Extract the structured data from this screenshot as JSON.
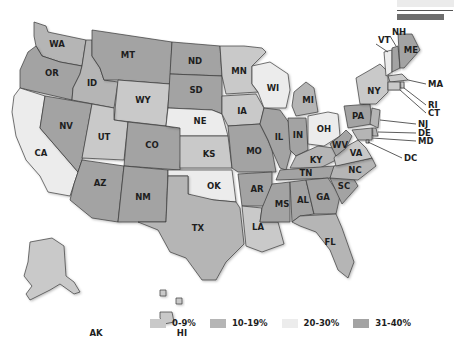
{
  "legend": {
    "items": [
      {
        "label": "0-9%",
        "color": "#c9c9c9"
      },
      {
        "label": "10-19%",
        "color": "#b5b5b5"
      },
      {
        "label": "20-30%",
        "color": "#ececec"
      },
      {
        "label": "31-40%",
        "color": "#a3a3a3"
      }
    ]
  },
  "top_bars": {
    "light": "#ebebeb",
    "dark": "#6e6e6e"
  },
  "chart_data": {
    "type": "choropleth",
    "title": "",
    "categories": [
      "0-9%",
      "10-19%",
      "20-30%",
      "31-40%"
    ],
    "states": {
      "WA": "10-19%",
      "OR": "31-40%",
      "CA": "20-30%",
      "ID": "10-19%",
      "NV": "31-40%",
      "MT": "31-40%",
      "WY": "0-9%",
      "UT": "0-9%",
      "AZ": "31-40%",
      "CO": "31-40%",
      "NM": "31-40%",
      "ND": "31-40%",
      "SD": "31-40%",
      "NE": "20-30%",
      "KS": "0-9%",
      "OK": "20-30%",
      "TX": "10-19%",
      "MN": "0-9%",
      "IA": "0-9%",
      "MO": "31-40%",
      "AR": "31-40%",
      "LA": "0-9%",
      "WI": "20-30%",
      "IL": "31-40%",
      "MI": "10-19%",
      "IN": "31-40%",
      "OH": "20-30%",
      "KY": "10-19%",
      "TN": "31-40%",
      "MS": "31-40%",
      "AL": "31-40%",
      "GA": "31-40%",
      "FL": "10-19%",
      "SC": "31-40%",
      "NC": "10-19%",
      "VA": "0-9%",
      "WV": "31-40%",
      "PA": "31-40%",
      "NY": "0-9%",
      "VT": "20-30%",
      "NH": "31-40%",
      "ME": "31-40%",
      "MA": "0-9%",
      "RI": "0-9%",
      "CT": "0-9%",
      "NJ": "10-19%",
      "DE": "10-19%",
      "MD": "10-19%",
      "DC": "10-19%",
      "AK": "0-9%",
      "HI": "0-9%"
    },
    "state_labels": [
      "WA",
      "OR",
      "CA",
      "ID",
      "NV",
      "MT",
      "WY",
      "UT",
      "AZ",
      "CO",
      "NM",
      "ND",
      "SD",
      "NE",
      "KS",
      "OK",
      "TX",
      "MN",
      "IA",
      "MO",
      "AR",
      "LA",
      "WI",
      "IL",
      "MI",
      "IN",
      "OH",
      "KY",
      "TN",
      "MS",
      "AL",
      "GA",
      "FL",
      "SC",
      "NC",
      "VA",
      "WV",
      "PA",
      "NY",
      "VT",
      "NH",
      "ME",
      "MA",
      "RI",
      "CT",
      "NJ",
      "DE",
      "MD",
      "DC",
      "AK",
      "HI"
    ],
    "legend_position": "bottom"
  }
}
